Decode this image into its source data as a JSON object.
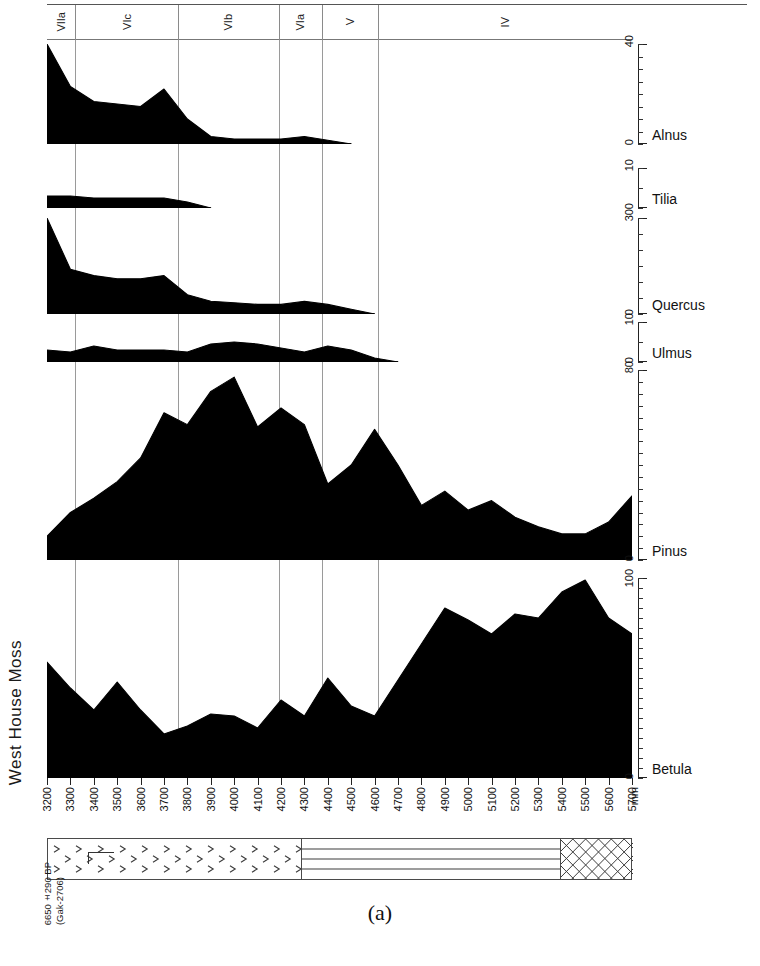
{
  "figure": {
    "site_title": "West House Moss",
    "caption": "(a)",
    "depth_unit": "mm"
  },
  "radiocarbon": {
    "date": "6650±290 BP",
    "lab_code": "(Gak-2706)",
    "depth_mm": 5400
  },
  "zones": [
    {
      "label": "VIIa",
      "start_mm": 3200,
      "end_mm": 3320
    },
    {
      "label": "VIc",
      "start_mm": 3320,
      "end_mm": 3760
    },
    {
      "label": "VIb",
      "start_mm": 3760,
      "end_mm": 4190
    },
    {
      "label": "VIa",
      "start_mm": 4190,
      "end_mm": 4375
    },
    {
      "label": "V",
      "start_mm": 4375,
      "end_mm": 4615
    },
    {
      "label": "IV",
      "start_mm": 4615,
      "end_mm": 5700
    }
  ],
  "depth_axis": {
    "label": "mm",
    "min_mm": 3200,
    "max_mm": 5700,
    "tick_step": 100,
    "ticks": [
      3200,
      3300,
      3400,
      3500,
      3600,
      3700,
      3800,
      3900,
      4000,
      4100,
      4200,
      4300,
      4400,
      4500,
      4600,
      4700,
      4800,
      4900,
      5000,
      5100,
      5200,
      5300,
      5400,
      5500,
      5600,
      5700
    ]
  },
  "lithology": {
    "units": [
      {
        "name": "detritus-peat",
        "pattern": "chevron",
        "start_mm": 3200,
        "end_mm": 4280
      },
      {
        "name": "laminated-mud",
        "pattern": "horizontal-lines",
        "start_mm": 4280,
        "end_mm": 5390
      },
      {
        "name": "clay-gyttja",
        "pattern": "cross-hatch",
        "start_mm": 5390,
        "end_mm": 5700
      }
    ]
  },
  "chart_data": {
    "type": "area",
    "title": "West House Moss",
    "subtitle": "(a)",
    "xlabel": "mm",
    "ylabel": "Pollen percentage",
    "orientation": "horizontal-depth",
    "grid": false,
    "legend_position": "right",
    "x": [
      3200,
      3300,
      3400,
      3500,
      3600,
      3700,
      3800,
      3900,
      4000,
      4100,
      4200,
      4300,
      4400,
      4500,
      4600,
      4700,
      4800,
      4900,
      5000,
      5100,
      5200,
      5300,
      5400,
      5500,
      5600,
      5700
    ],
    "series": [
      {
        "name": "Alnus",
        "ylim": [
          0,
          40
        ],
        "tick_step": 5,
        "values": [
          40,
          23,
          17,
          16,
          15,
          22,
          10,
          3,
          2,
          2,
          2,
          3,
          1.5,
          0,
          0,
          0,
          0,
          0,
          0,
          0,
          0,
          0,
          0,
          0,
          0,
          0
        ]
      },
      {
        "name": "Tilia",
        "ylim": [
          0,
          10
        ],
        "tick_step": 5,
        "values": [
          3,
          3,
          2.5,
          2.5,
          2.5,
          2.5,
          1.5,
          0,
          0,
          0,
          0,
          0,
          0,
          0,
          0,
          0,
          0,
          0,
          0,
          0,
          0,
          0,
          0,
          0,
          0,
          0
        ]
      },
      {
        "name": "Quercus",
        "ylim": [
          0,
          30
        ],
        "tick_step": 5,
        "values": [
          30,
          14,
          12,
          11,
          11,
          12,
          6,
          4,
          3.5,
          3,
          3,
          4,
          3,
          1.5,
          0,
          0,
          0,
          0,
          0,
          0,
          0,
          0,
          0,
          0,
          0,
          0
        ]
      },
      {
        "name": "Ulmus",
        "ylim": [
          0,
          10
        ],
        "tick_step": 5,
        "values": [
          3,
          2.5,
          4,
          3,
          3,
          3,
          2.5,
          4.5,
          5,
          4.5,
          3.5,
          2.5,
          4,
          3,
          1,
          0,
          0,
          0,
          0,
          0,
          0,
          0,
          0,
          0,
          0,
          0
        ]
      },
      {
        "name": "Pinus",
        "ylim": [
          0,
          80
        ],
        "tick_step": 5,
        "values": [
          10,
          20,
          26,
          33,
          43,
          62,
          57,
          71,
          77,
          56,
          64,
          57,
          32,
          40,
          55,
          40,
          23,
          29,
          21,
          25,
          18,
          14,
          11,
          11,
          16,
          27
        ]
      },
      {
        "name": "Betula",
        "ylim": [
          0,
          100
        ],
        "tick_step": 5,
        "values": [
          58,
          45,
          34,
          48,
          34,
          22,
          26,
          32,
          31,
          25,
          39,
          31,
          50,
          36,
          31,
          49,
          67,
          85,
          79,
          72,
          82,
          80,
          93,
          99,
          80,
          72
        ]
      }
    ]
  }
}
